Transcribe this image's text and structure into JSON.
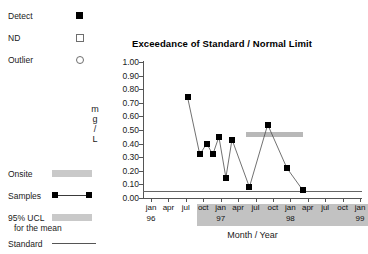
{
  "legend_top": [
    {
      "label": "Detect",
      "marker": "filled-square",
      "name": "legend-detect"
    },
    {
      "label": "ND",
      "marker": "open-square",
      "name": "legend-nd"
    },
    {
      "label": "Outlier",
      "marker": "open-circle",
      "name": "legend-outlier"
    }
  ],
  "legend_bottom": [
    {
      "label": "Onsite",
      "marker": "gray-band",
      "name": "legend-onsite",
      "sub": ""
    },
    {
      "label": "Samples",
      "marker": "line-markers",
      "name": "legend-samples",
      "sub": ""
    },
    {
      "label": "95% UCL",
      "marker": "gray-band",
      "name": "legend-95-ucl",
      "sub": "for the mean"
    },
    {
      "label": "Standard",
      "marker": "thin-line",
      "name": "legend-standard",
      "sub": ""
    }
  ],
  "chart_data": {
    "type": "line",
    "title": "Exceedance of Standard / Normal Limit",
    "xlabel": "Month / Year",
    "ylabel": "mg/L",
    "ylabel_stacked": [
      "m",
      "g",
      "/",
      "L"
    ],
    "ylim": [
      0.0,
      1.0
    ],
    "ytick_step": 0.1,
    "ytick_labels": [
      "1.00",
      "0.90",
      "0.80",
      "0.70",
      "0.60",
      "0.50",
      "0.40",
      "0.30",
      "0.20",
      "0.10",
      "0.00"
    ],
    "ytick_values": [
      1.0,
      0.9,
      0.8,
      0.7,
      0.6,
      0.5,
      0.4,
      0.3,
      0.2,
      0.1,
      0.0
    ],
    "grid": false,
    "legend_position": "left-outside",
    "x_months": [
      "jan",
      "apr",
      "jul",
      "oct",
      "jan",
      "apr",
      "jul",
      "oct",
      "jan",
      "apr",
      "jul",
      "oct",
      "jan"
    ],
    "x_years": [
      {
        "label": "96",
        "tick_index": 0
      },
      {
        "label": "97",
        "tick_index": 4
      },
      {
        "label": "98",
        "tick_index": 8
      },
      {
        "label": "99",
        "tick_index": 12
      }
    ],
    "xlim_index": [
      0,
      12
    ],
    "series": [
      {
        "name": "Samples",
        "marker": "filled-square",
        "x": [
          2.1,
          2.8,
          3.2,
          3.55,
          3.9,
          4.3,
          4.65,
          5.65,
          6.7,
          7.8,
          8.7
        ],
        "x_labels": [
          "jul 96",
          "nov 96",
          "jan 97",
          "feb 97",
          "mar 97",
          "may 97",
          "jun 97",
          "sep 97",
          "jan 98",
          "apr 98",
          "jul 98"
        ],
        "values": [
          0.74,
          0.32,
          0.4,
          0.32,
          0.45,
          0.15,
          0.43,
          0.08,
          0.54,
          0.22,
          0.06
        ]
      }
    ],
    "ucl_band": {
      "name": "95% UCL for the mean",
      "value": 0.47,
      "x_start": 5.45,
      "x_end": 8.7,
      "color": "#b8b8b8"
    },
    "standard_line": {
      "name": "Standard",
      "value": 0.05,
      "color": "#666666"
    },
    "onsite_band": {
      "name": "Onsite",
      "x_start": 3.0,
      "x_end": 12.0,
      "color": "#c2c2c2"
    }
  },
  "colors": {
    "marker": "#000000",
    "series_line": "#4d4d4d",
    "axis": "#555555",
    "onsite": "#c2c2c2",
    "ucl": "#b8b8b8",
    "standard": "#666666",
    "background": "#ffffff"
  }
}
